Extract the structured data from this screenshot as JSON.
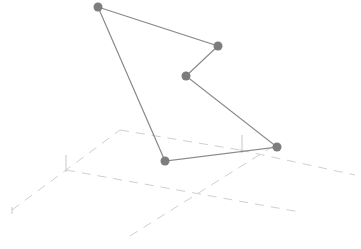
{
  "chart_data": {
    "type": "line",
    "subtype": "3d-line-with-markers",
    "title": "",
    "xlabel": "",
    "ylabel": "",
    "zlabel": "",
    "legend": [],
    "grid": false,
    "axes_visible": false,
    "series": [
      {
        "name": "trace 0",
        "color": "#7d7d7d",
        "mode": "lines+markers",
        "closed": true,
        "screen_points": [
          {
            "x": 98,
            "y": 7
          },
          {
            "x": 218,
            "y": 46
          },
          {
            "x": 186,
            "y": 76
          },
          {
            "x": 277,
            "y": 147
          },
          {
            "x": 165,
            "y": 161
          },
          {
            "x": 98,
            "y": 7
          }
        ]
      }
    ],
    "guide_lines": [
      {
        "x1": 12,
        "y1": 210,
        "x2": 120,
        "y2": 130
      },
      {
        "x1": 120,
        "y1": 130,
        "x2": 240,
        "y2": 150
      },
      {
        "x1": 240,
        "y1": 150,
        "x2": 355,
        "y2": 175
      },
      {
        "x1": 66,
        "y1": 170,
        "x2": 300,
        "y2": 212
      },
      {
        "x1": 130,
        "y1": 236,
        "x2": 275,
        "y2": 145
      }
    ],
    "ticks": [
      {
        "x1": 66,
        "y1": 155,
        "x2": 66,
        "y2": 172
      },
      {
        "x1": 242,
        "y1": 135,
        "x2": 242,
        "y2": 153
      },
      {
        "x1": 12,
        "y1": 207,
        "x2": 12,
        "y2": 214
      }
    ]
  },
  "colors": {
    "background": "#ffffff",
    "trace": "#8a8a8a",
    "marker": "#7d7d7d",
    "guide": "#cfcfcf"
  }
}
